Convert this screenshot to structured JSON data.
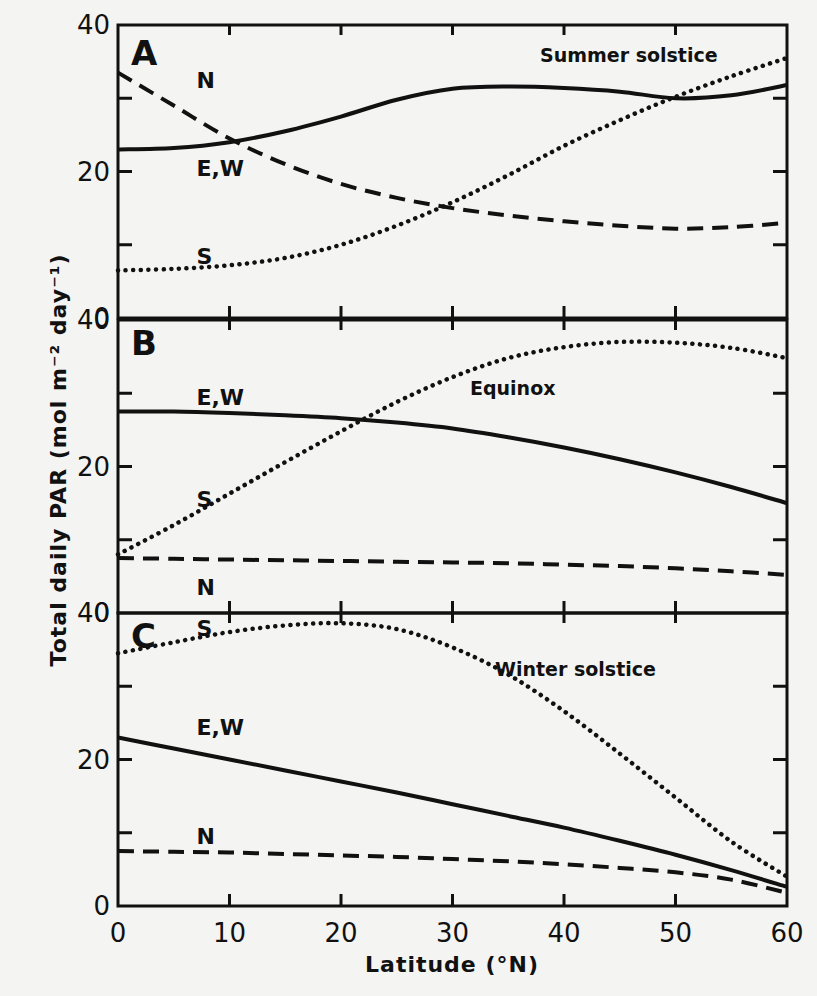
{
  "figure": {
    "ylabel": "Total daily PAR (mol m⁻² day⁻¹)",
    "xlabel": "Latitude (°N)",
    "x_ticks": [
      "0",
      "10",
      "20",
      "30",
      "40",
      "50",
      "60"
    ],
    "y_ticks": [
      "0",
      "20",
      "40"
    ]
  },
  "panels": [
    {
      "letter": "A",
      "season": "Summer solstice"
    },
    {
      "letter": "B",
      "season": "Equinox"
    },
    {
      "letter": "C",
      "season": "Winter solstice"
    }
  ],
  "chart_data": [
    {
      "type": "line",
      "title": "A  Summer solstice",
      "xlabel": "Latitude (°N)",
      "ylabel": "Total daily PAR (mol m-2 day-1)",
      "x": [
        0,
        5,
        10,
        15,
        20,
        25,
        30,
        35,
        40,
        45,
        50,
        55,
        60
      ],
      "xlim": [
        0,
        60
      ],
      "ylim": [
        0,
        40
      ],
      "grid": false,
      "series": [
        {
          "name": "E,W",
          "style": "solid",
          "values": [
            23.0,
            23.2,
            24.0,
            25.5,
            27.5,
            29.8,
            31.3,
            31.6,
            31.4,
            30.9,
            30.0,
            30.4,
            31.8
          ]
        },
        {
          "name": "N",
          "style": "dashed",
          "values": [
            33.5,
            29.0,
            24.5,
            21.0,
            18.3,
            16.4,
            15.0,
            14.0,
            13.2,
            12.6,
            12.2,
            12.4,
            13.0
          ]
        },
        {
          "name": "S",
          "style": "dotted",
          "values": [
            6.5,
            6.7,
            7.2,
            8.2,
            10.0,
            12.6,
            15.8,
            19.5,
            23.5,
            27.0,
            30.2,
            33.0,
            35.5
          ]
        }
      ]
    },
    {
      "type": "line",
      "title": "B  Equinox",
      "xlabel": "Latitude (°N)",
      "ylabel": "Total daily PAR (mol m-2 day-1)",
      "x": [
        0,
        5,
        10,
        15,
        20,
        25,
        30,
        35,
        40,
        45,
        50,
        55,
        60
      ],
      "xlim": [
        0,
        60
      ],
      "ylim": [
        0,
        40
      ],
      "grid": false,
      "series": [
        {
          "name": "E,W",
          "style": "solid",
          "values": [
            27.5,
            27.5,
            27.3,
            27.0,
            26.6,
            26.0,
            25.2,
            24.0,
            22.6,
            21.0,
            19.2,
            17.2,
            15.0
          ]
        },
        {
          "name": "N",
          "style": "dashed",
          "values": [
            7.5,
            7.4,
            7.3,
            7.2,
            7.1,
            7.0,
            6.9,
            6.8,
            6.6,
            6.4,
            6.1,
            5.7,
            5.2
          ]
        },
        {
          "name": "S",
          "style": "dotted",
          "values": [
            8.0,
            12.0,
            16.3,
            20.6,
            24.8,
            28.8,
            32.2,
            34.8,
            36.3,
            37.0,
            36.9,
            36.2,
            34.8
          ]
        }
      ]
    },
    {
      "type": "line",
      "title": "C  Winter solstice",
      "xlabel": "Latitude (°N)",
      "ylabel": "Total daily PAR (mol m-2 day-1)",
      "x": [
        0,
        5,
        10,
        15,
        20,
        25,
        30,
        35,
        40,
        45,
        50,
        55,
        60
      ],
      "xlim": [
        0,
        60
      ],
      "ylim": [
        0,
        40
      ],
      "grid": false,
      "series": [
        {
          "name": "E,W",
          "style": "solid",
          "values": [
            23.0,
            21.5,
            20.0,
            18.5,
            17.0,
            15.5,
            13.9,
            12.3,
            10.7,
            8.9,
            7.0,
            4.9,
            2.6
          ]
        },
        {
          "name": "N",
          "style": "dashed",
          "values": [
            7.5,
            7.4,
            7.3,
            7.1,
            6.9,
            6.7,
            6.4,
            6.1,
            5.7,
            5.2,
            4.6,
            3.6,
            1.8
          ]
        },
        {
          "name": "S",
          "style": "dotted",
          "values": [
            34.5,
            36.0,
            37.4,
            38.3,
            38.6,
            37.8,
            35.3,
            31.6,
            26.6,
            20.8,
            14.8,
            8.8,
            4.0
          ]
        }
      ]
    }
  ]
}
